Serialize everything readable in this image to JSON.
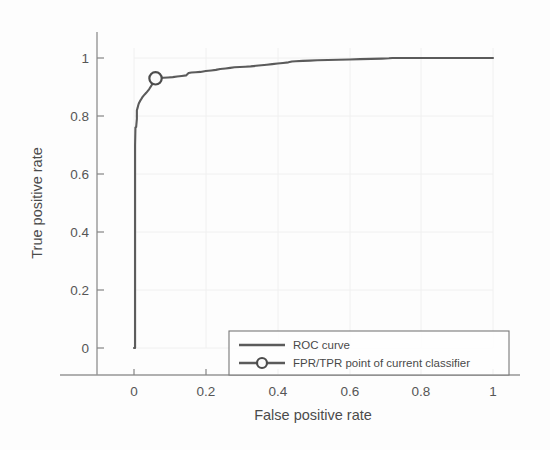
{
  "figure": {
    "background_color": "#fdfdfd",
    "curve_color": "#4f4f4f",
    "axis_color": "#8f8f8f",
    "grid_color": "#f0f0f0"
  },
  "axes": {
    "x_title": "False positive rate",
    "y_title": "True positive rate",
    "x_ticks": [
      "0",
      "0.2",
      "0.4",
      "0.6",
      "0.8",
      "1"
    ],
    "y_ticks": [
      "0",
      "0.2",
      "0.4",
      "0.6",
      "0.8",
      "1"
    ]
  },
  "legend": {
    "items": [
      {
        "label": "ROC curve",
        "marker": "line"
      },
      {
        "label": "FPR/TPR point of current classifier",
        "marker": "line-with-circle"
      }
    ]
  },
  "chart_data": {
    "type": "line",
    "title": "",
    "xlabel": "False positive rate",
    "ylabel": "True positive rate",
    "xlim": [
      0,
      1
    ],
    "ylim": [
      0,
      1
    ],
    "x_ticks": [
      0,
      0.2,
      0.4,
      0.6,
      0.8,
      1
    ],
    "y_ticks": [
      0,
      0.2,
      0.4,
      0.6,
      0.8,
      1
    ],
    "grid": true,
    "legend_position": "lower right",
    "series": [
      {
        "name": "ROC curve",
        "type": "line",
        "x": [
          0.0,
          0.003,
          0.003,
          0.003,
          0.003,
          0.004,
          0.006,
          0.008,
          0.008,
          0.01,
          0.012,
          0.014,
          0.017,
          0.02,
          0.024,
          0.028,
          0.031,
          0.034,
          0.038,
          0.042,
          0.046,
          0.05,
          0.055,
          0.06,
          0.07,
          0.082,
          0.095,
          0.108,
          0.12,
          0.133,
          0.145,
          0.152,
          0.16,
          0.172,
          0.185,
          0.2,
          0.215,
          0.228,
          0.24,
          0.255,
          0.268,
          0.28,
          0.295,
          0.31,
          0.325,
          0.34,
          0.355,
          0.37,
          0.385,
          0.4,
          0.415,
          0.43,
          0.44,
          0.45,
          0.47,
          0.49,
          0.51,
          0.54,
          0.57,
          0.6,
          0.63,
          0.66,
          0.69,
          0.71,
          0.72,
          0.76,
          0.8,
          0.85,
          0.9,
          0.95,
          1.0
        ],
        "y": [
          0.0,
          0.0,
          0.33,
          0.56,
          0.7,
          0.76,
          0.762,
          0.79,
          0.82,
          0.828,
          0.838,
          0.845,
          0.852,
          0.858,
          0.866,
          0.872,
          0.876,
          0.88,
          0.886,
          0.892,
          0.9,
          0.908,
          0.918,
          0.93,
          0.931,
          0.932,
          0.933,
          0.934,
          0.936,
          0.938,
          0.94,
          0.948,
          0.95,
          0.951,
          0.952,
          0.955,
          0.957,
          0.959,
          0.962,
          0.964,
          0.966,
          0.968,
          0.969,
          0.97,
          0.971,
          0.973,
          0.975,
          0.977,
          0.979,
          0.981,
          0.983,
          0.985,
          0.988,
          0.989,
          0.99,
          0.991,
          0.992,
          0.993,
          0.994,
          0.995,
          0.996,
          0.997,
          0.998,
          0.999,
          1.0,
          1.0,
          1.0,
          1.0,
          1.0,
          1.0,
          1.0
        ]
      },
      {
        "name": "FPR/TPR point of current classifier",
        "type": "scatter",
        "marker": "o",
        "x": [
          0.06
        ],
        "y": [
          0.93
        ]
      }
    ]
  }
}
